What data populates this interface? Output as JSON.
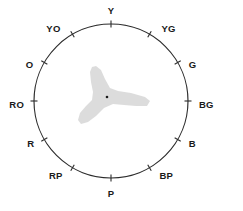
{
  "figure": {
    "type": "hue-circle-diagram",
    "title": "",
    "background_color": "#ffffff",
    "line_color": "#2b2b2b",
    "label_color": "#1a1a1a",
    "gamut_color": "#d9d9d9",
    "center_dot_color": "#1a1a1a"
  },
  "circle": {
    "center_x": 111,
    "center_y": 101,
    "radius": 77,
    "tick_length": 7
  },
  "chart_data": {
    "type": "scatter",
    "title": "",
    "xlabel": "",
    "ylabel": "",
    "legend": [],
    "categories": [
      "Y",
      "YG",
      "G",
      "BG",
      "B",
      "BP",
      "P",
      "RP",
      "R",
      "RO",
      "O",
      "YO"
    ],
    "angles_deg": [
      90,
      60,
      30,
      0,
      330,
      300,
      270,
      240,
      210,
      180,
      150,
      120
    ],
    "values": [
      1,
      1,
      1,
      1,
      1,
      1,
      1,
      1,
      1,
      1,
      1,
      1
    ],
    "annotations": [
      "center-point"
    ]
  },
  "hues": [
    {
      "label": "Y",
      "angle": 90,
      "label_dx": 0,
      "label_dy": -13,
      "anchor": "middle"
    },
    {
      "label": "YG",
      "angle": 60,
      "label_dx": 12,
      "label_dy": -5,
      "anchor": "start"
    },
    {
      "label": "G",
      "angle": 30,
      "label_dx": 11,
      "label_dy": 3,
      "anchor": "start"
    },
    {
      "label": "BG",
      "angle": 0,
      "label_dx": 11,
      "label_dy": 4,
      "anchor": "start"
    },
    {
      "label": "B",
      "angle": 330,
      "label_dx": 11,
      "label_dy": 5,
      "anchor": "start"
    },
    {
      "label": "BP",
      "angle": 300,
      "label_dx": 10,
      "label_dy": 9,
      "anchor": "start"
    },
    {
      "label": "P",
      "angle": 270,
      "label_dx": 0,
      "label_dy": 16,
      "anchor": "middle"
    },
    {
      "label": "RP",
      "angle": 240,
      "label_dx": -10,
      "label_dy": 9,
      "anchor": "end"
    },
    {
      "label": "R",
      "angle": 210,
      "label_dx": -10,
      "label_dy": 5,
      "anchor": "end"
    },
    {
      "label": "RO",
      "angle": 180,
      "label_dx": -10,
      "label_dy": 4,
      "anchor": "end"
    },
    {
      "label": "O",
      "angle": 150,
      "label_dx": -11,
      "label_dy": 3,
      "anchor": "end"
    },
    {
      "label": "YO",
      "angle": 120,
      "label_dx": -12,
      "label_dy": -5,
      "anchor": "end"
    }
  ],
  "gamut": {
    "name": "gamut-shape",
    "description": "tri-lobed gray region",
    "path": "M 96 66 L 101 70 L 105 79 L 110 88 L 118 91 L 131 93 L 145 97 L 150 101 L 147 106 L 136 106 L 124 105 L 113 104 L 104 108 L 96 116 L 88 122 L 81 124 L 78 120 L 80 113 L 86 106 L 92 100 L 93 92 L 91 82 L 90 72 L 92 67 Z",
    "center_dot": {
      "x": 107,
      "y": 97,
      "r": 1.3
    }
  }
}
